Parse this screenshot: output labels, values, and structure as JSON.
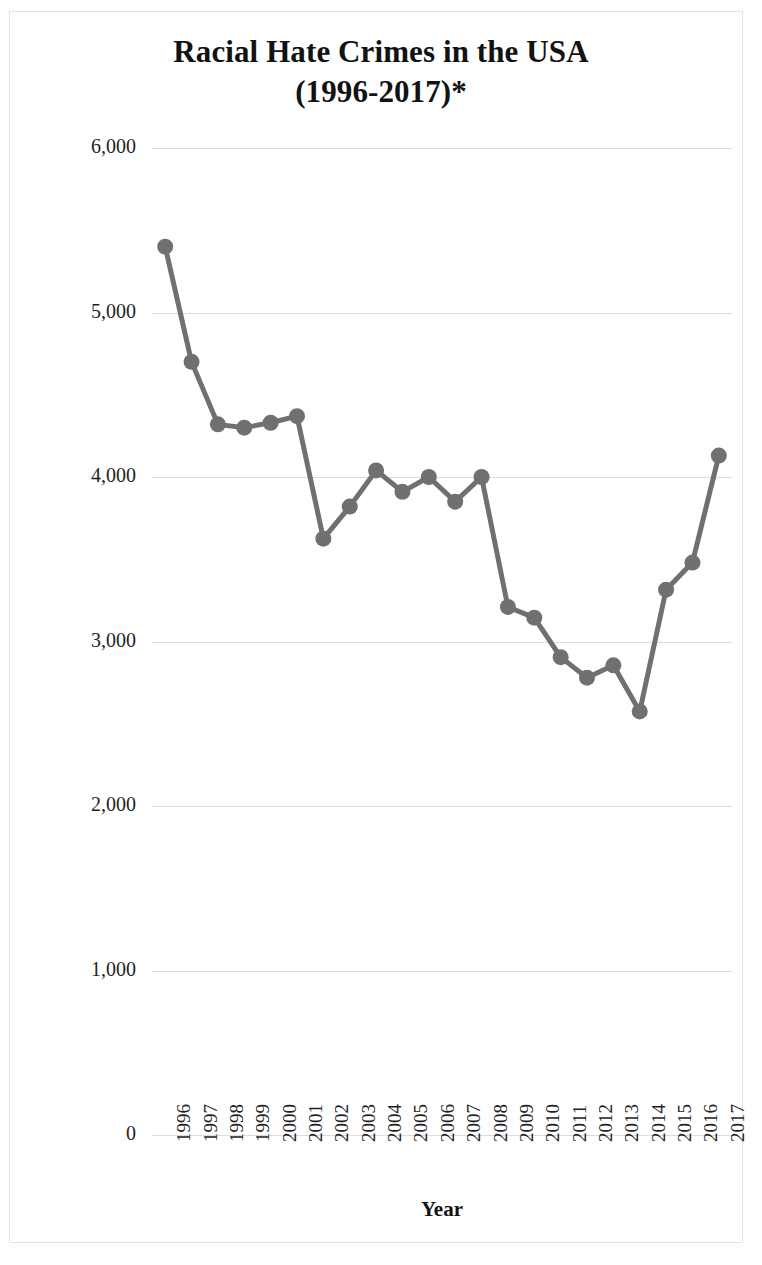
{
  "chart_data": {
    "type": "line",
    "title": "Racial Hate Crimes in the USA (1996-2017)*",
    "title_lines": [
      "Racial Hate Crimes in the USA",
      "(1996-2017)*"
    ],
    "xlabel": "Year",
    "ylabel": "# of Racial Hate Crime Incidents",
    "categories": [
      "1996",
      "1997",
      "1998",
      "1999",
      "2000",
      "2001",
      "2002",
      "2003",
      "2004",
      "2005",
      "2006",
      "2007",
      "2008",
      "2009",
      "2010",
      "2011",
      "2012",
      "2013",
      "2014",
      "2015",
      "2016",
      "2017"
    ],
    "values": [
      5400,
      4700,
      4320,
      4300,
      4330,
      4370,
      3625,
      3820,
      4040,
      3910,
      4000,
      3850,
      4000,
      3210,
      3145,
      2905,
      2780,
      2855,
      2575,
      3315,
      3480,
      4130
    ],
    "ylim": [
      0,
      6000
    ],
    "ytick_values": [
      6000,
      5000,
      4000,
      3000,
      2000,
      1000,
      0
    ],
    "ytick_labels": [
      "6,000",
      "5,000",
      "4,000",
      "3,000",
      "2,000",
      "1,000",
      "0"
    ],
    "grid": true,
    "legend": null,
    "series_color": "#707070",
    "gridline_color": "#dcdcdc",
    "marker": "circle",
    "annotations": []
  }
}
